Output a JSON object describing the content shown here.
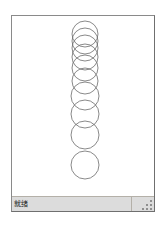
{
  "window": {
    "title": "",
    "client_background": "#ffffff",
    "frame_color": "#8a8a8a"
  },
  "canvas": {
    "name": "drawing-canvas",
    "background": "#ffffff",
    "stroke_color": "#6b6b6b",
    "fill": "none",
    "stroke_width": 0.8,
    "description": "vertical stack of overlapping outlined circles"
  },
  "shapes": {
    "type": "circle-stack",
    "count": 10,
    "circles": [
      {
        "index": 1,
        "cx": 73,
        "cy": 18,
        "r": 13
      },
      {
        "index": 2,
        "cx": 73,
        "cy": 25,
        "r": 13
      },
      {
        "index": 3,
        "cx": 73,
        "cy": 32,
        "r": 13
      },
      {
        "index": 4,
        "cx": 73,
        "cy": 41,
        "r": 13
      },
      {
        "index": 5,
        "cx": 73,
        "cy": 52,
        "r": 13
      },
      {
        "index": 6,
        "cx": 73,
        "cy": 65,
        "r": 13
      },
      {
        "index": 7,
        "cx": 73,
        "cy": 80,
        "r": 14
      },
      {
        "index": 8,
        "cx": 73,
        "cy": 98,
        "r": 14
      },
      {
        "index": 9,
        "cx": 73,
        "cy": 119,
        "r": 14
      },
      {
        "index": 10,
        "cx": 73,
        "cy": 149,
        "r": 14
      }
    ]
  },
  "status_bar": {
    "background": "#dcdcdc",
    "text": "就绪",
    "grip": "resize-grip"
  }
}
